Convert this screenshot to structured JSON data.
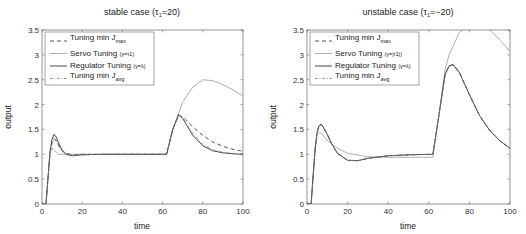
{
  "chart_data": [
    {
      "type": "line",
      "title": "stable case (τ1=20)",
      "title_main": "stable case (τ",
      "title_sub": "1",
      "title_end": "=20)",
      "xlabel": "time",
      "ylabel": "output",
      "xlim": [
        0,
        100
      ],
      "ylim": [
        0,
        3.5
      ],
      "xticks": [
        "0",
        "20",
        "40",
        "60",
        "80",
        "100"
      ],
      "yticks": [
        "0",
        "0.5",
        "1",
        "1.5",
        "2",
        "2.5",
        "3",
        "3.5"
      ],
      "grid": false,
      "legend_position": "upper left",
      "legend": [
        {
          "main": "Tuning min J",
          "sub": "max",
          "tail": "",
          "style": "dashed"
        },
        {
          "main": "Servo Tuning ",
          "sub": "",
          "tail": "(γ=τ1)",
          "style": "solid-light"
        },
        {
          "main": "Regulator Tuning ",
          "sub": "",
          "tail": "(γ=λ)",
          "style": "solid"
        },
        {
          "main": "Tuning min J",
          "sub": "avg",
          "tail": "",
          "style": "dashdot"
        }
      ],
      "series": [
        {
          "name": "Tuning min Jmax",
          "x": [
            0,
            2,
            4,
            5,
            6,
            7,
            8,
            10,
            12,
            15,
            20,
            30,
            40,
            60,
            62,
            65,
            68,
            70,
            75,
            80,
            85,
            90,
            95,
            100
          ],
          "values": [
            0,
            0,
            1.0,
            1.25,
            1.32,
            1.28,
            1.2,
            1.08,
            1.02,
            0.99,
            1.0,
            1.0,
            1.0,
            1.0,
            1.0,
            1.5,
            1.78,
            1.75,
            1.55,
            1.38,
            1.25,
            1.16,
            1.1,
            1.06
          ]
        },
        {
          "name": "Servo Tuning (γ=τ1)",
          "x": [
            0,
            2,
            4,
            5,
            6,
            8,
            10,
            15,
            20,
            40,
            60,
            62,
            65,
            70,
            75,
            80,
            85,
            90,
            95,
            100
          ],
          "values": [
            0,
            0,
            1.05,
            1.12,
            1.08,
            1.0,
            1.0,
            1.0,
            1.0,
            1.0,
            1.0,
            1.0,
            1.5,
            2.05,
            2.35,
            2.5,
            2.48,
            2.4,
            2.3,
            2.17
          ]
        },
        {
          "name": "Regulator Tuning (γ=λ)",
          "x": [
            0,
            2,
            4,
            5,
            6,
            7,
            8,
            10,
            12,
            15,
            20,
            30,
            40,
            60,
            62,
            65,
            68,
            70,
            75,
            80,
            85,
            90,
            95,
            100
          ],
          "values": [
            0,
            0,
            1.05,
            1.3,
            1.4,
            1.35,
            1.25,
            1.08,
            1.0,
            0.97,
            0.99,
            1.0,
            1.0,
            1.0,
            1.0,
            1.5,
            1.8,
            1.72,
            1.38,
            1.17,
            1.07,
            1.03,
            1.01,
            1.0
          ]
        },
        {
          "name": "Tuning min Javg",
          "x": [
            0,
            2,
            4,
            5,
            6,
            7,
            8,
            10,
            12,
            15,
            20,
            30,
            40,
            60,
            62,
            65,
            68,
            70,
            75,
            80,
            85,
            90,
            95,
            100
          ],
          "values": [
            0,
            0,
            1.02,
            1.22,
            1.3,
            1.26,
            1.18,
            1.06,
            1.01,
            0.98,
            0.99,
            1.0,
            1.0,
            1.0,
            1.0,
            1.5,
            1.79,
            1.73,
            1.42,
            1.2,
            1.09,
            1.04,
            1.02,
            1.01
          ]
        }
      ]
    },
    {
      "type": "line",
      "title": "unstable case (τ1=−20)",
      "title_main": "unstable case (τ",
      "title_sub": "1",
      "title_end": "=−20)",
      "xlabel": "time",
      "ylabel": "output",
      "xlim": [
        0,
        100
      ],
      "ylim": [
        0,
        3.5
      ],
      "xticks": [
        "0",
        "20",
        "40",
        "60",
        "80",
        "100"
      ],
      "yticks": [
        "0",
        "0.5",
        "1",
        "1.5",
        "2",
        "2.5",
        "3",
        "3.5"
      ],
      "grid": false,
      "legend_position": "upper left",
      "legend": [
        {
          "main": "Tuning min J",
          "sub": "max",
          "tail": "",
          "style": "dashed"
        },
        {
          "main": "Servo Tuning ",
          "sub": "",
          "tail": "(γ=|τ1|)",
          "style": "solid-light"
        },
        {
          "main": "Regulator Tuning ",
          "sub": "",
          "tail": "(γ=λ)",
          "style": "solid"
        },
        {
          "main": "Tuning min J",
          "sub": "avg",
          "tail": "",
          "style": "dashdot"
        }
      ],
      "series": [
        {
          "name": "Tuning min Jmax",
          "x": [
            0,
            2,
            4,
            5,
            6,
            7,
            8,
            10,
            12,
            15,
            20,
            25,
            30,
            40,
            50,
            62,
            65,
            68,
            70,
            72,
            75,
            80,
            85,
            90,
            95,
            100
          ],
          "values": [
            0,
            0,
            1.1,
            1.45,
            1.58,
            1.6,
            1.55,
            1.4,
            1.22,
            1.02,
            0.88,
            0.87,
            0.92,
            0.97,
            0.99,
            1.0,
            1.8,
            2.6,
            2.78,
            2.8,
            2.65,
            2.2,
            1.78,
            1.48,
            1.27,
            1.12
          ]
        },
        {
          "name": "Servo Tuning (γ=|τ1|)",
          "x": [
            0,
            2,
            4,
            5,
            6,
            8,
            10,
            15,
            20,
            30,
            40,
            50,
            62,
            65,
            68,
            70,
            75,
            80,
            85,
            90,
            95,
            100
          ],
          "values": [
            0,
            0,
            1.1,
            1.4,
            1.45,
            1.38,
            1.28,
            1.12,
            1.02,
            0.95,
            0.94,
            0.94,
            0.94,
            1.8,
            2.7,
            3.0,
            3.45,
            3.6,
            3.6,
            3.5,
            3.3,
            3.07
          ]
        },
        {
          "name": "Regulator Tuning (γ=λ)",
          "x": [
            0,
            2,
            4,
            5,
            6,
            7,
            8,
            10,
            12,
            15,
            20,
            25,
            30,
            40,
            50,
            62,
            65,
            68,
            70,
            72,
            75,
            80,
            85,
            90,
            95,
            100
          ],
          "values": [
            0,
            0,
            1.1,
            1.45,
            1.58,
            1.6,
            1.55,
            1.4,
            1.22,
            1.02,
            0.88,
            0.87,
            0.92,
            0.97,
            0.99,
            1.0,
            1.8,
            2.6,
            2.78,
            2.8,
            2.65,
            2.2,
            1.78,
            1.48,
            1.27,
            1.12
          ]
        },
        {
          "name": "Tuning min Javg",
          "x": [
            0,
            2,
            4,
            5,
            6,
            7,
            8,
            10,
            12,
            15,
            20,
            25,
            30,
            40,
            50,
            62,
            65,
            68,
            70,
            72,
            75,
            80,
            85,
            90,
            95,
            100
          ],
          "values": [
            0,
            0,
            1.1,
            1.44,
            1.57,
            1.59,
            1.54,
            1.39,
            1.21,
            1.01,
            0.88,
            0.87,
            0.92,
            0.97,
            0.99,
            1.0,
            1.79,
            2.58,
            2.77,
            2.79,
            2.64,
            2.2,
            1.78,
            1.48,
            1.27,
            1.12
          ]
        }
      ]
    }
  ]
}
